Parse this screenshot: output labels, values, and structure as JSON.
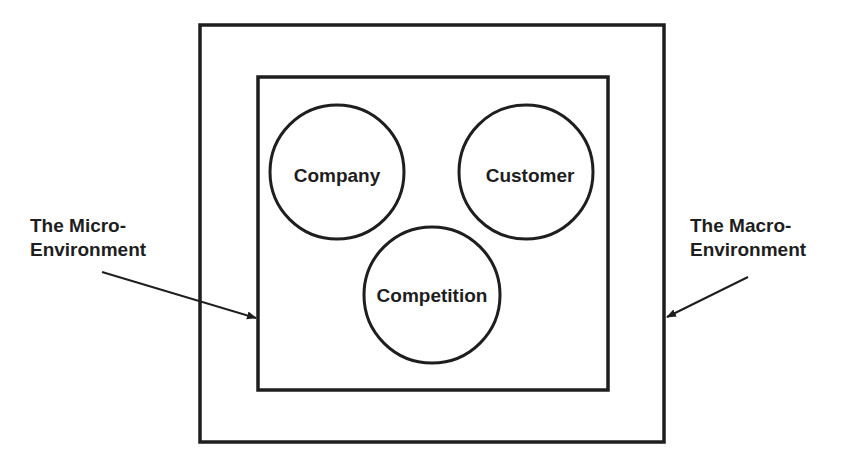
{
  "diagram": {
    "outer_box_label": "The Macro-Environment",
    "inner_box_label": "The Micro-Environment",
    "left_label": {
      "line1": "The Micro-",
      "line2": "Environment"
    },
    "right_label": {
      "line1": "The Macro-",
      "line2": "Environment"
    },
    "circles": [
      {
        "label": "Company"
      },
      {
        "label": "Customer"
      },
      {
        "label": "Competition"
      }
    ],
    "colors": {
      "stroke": "#1e1e1e",
      "background": "#ffffff"
    }
  }
}
